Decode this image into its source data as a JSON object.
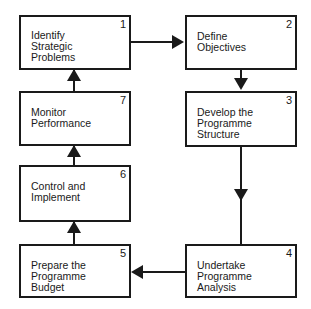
{
  "diagram": {
    "type": "process-cycle",
    "steps": [
      {
        "number": "1",
        "label": "Identify\nStrategic\nProblems"
      },
      {
        "number": "2",
        "label": "Define\nObjectives"
      },
      {
        "number": "3",
        "label": "Develop the\nProgramme\nStructure"
      },
      {
        "number": "4",
        "label": "Undertake\nProgramme\nAnalysis"
      },
      {
        "number": "5",
        "label": "Prepare the\nProgramme\nBudget"
      },
      {
        "number": "6",
        "label": "Control and\nImplement"
      },
      {
        "number": "7",
        "label": "Monitor\nPerformance"
      }
    ],
    "flow": [
      "1->2",
      "2->3",
      "3->4",
      "4->5",
      "5->6",
      "6->7",
      "7->1"
    ],
    "colors": {
      "line": "#1a1a1a",
      "background": "#ffffff"
    }
  }
}
